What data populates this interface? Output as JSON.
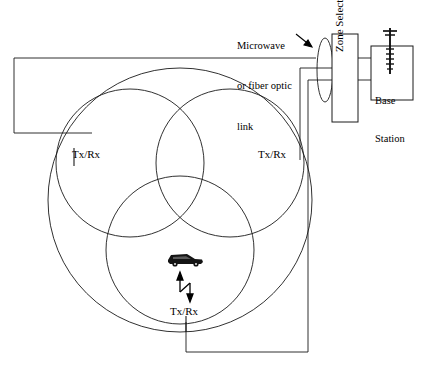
{
  "figure": {
    "type": "network-coverage-diagram",
    "stroke_color": "#000000",
    "background_color": "#ffffff"
  },
  "annotations": {
    "link_label_line1": "Microwave",
    "link_label_line2": "or fiber optic",
    "link_label_line3": "link"
  },
  "boxes": {
    "zone_selector": "Zone Selector",
    "base_station_line1": "Base",
    "base_station_line2": "Station"
  },
  "sites": [
    {
      "id": "top-left",
      "label": "Tx/Rx"
    },
    {
      "id": "top-right",
      "label": "Tx/Rx"
    },
    {
      "id": "bottom-center",
      "label": "Tx/Rx"
    }
  ],
  "mobile": {
    "icon": "car-icon",
    "link_icon": "bidirectional-arrow-icon"
  },
  "icons": {
    "antenna": "antenna-icon",
    "link_marker": "ellipse-link-icon",
    "pointer": "arrow-icon"
  },
  "geometry": {
    "outer_circle": {
      "cx": 180,
      "cy": 200,
      "r": 132
    },
    "inner_circles": [
      {
        "cx": 130,
        "cy": 163,
        "r": 74
      },
      {
        "cx": 230,
        "cy": 163,
        "r": 74
      },
      {
        "cx": 180,
        "cy": 250,
        "r": 74
      }
    ]
  }
}
